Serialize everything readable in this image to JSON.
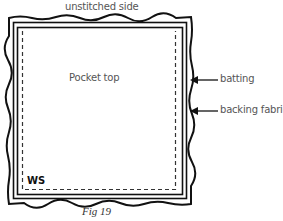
{
  "figure": {
    "caption": "Fig 19",
    "labels": {
      "top": "unstitched side",
      "center": "Pocket top",
      "batting": "batting",
      "backing": "backing fabric",
      "corner": "WS"
    }
  }
}
